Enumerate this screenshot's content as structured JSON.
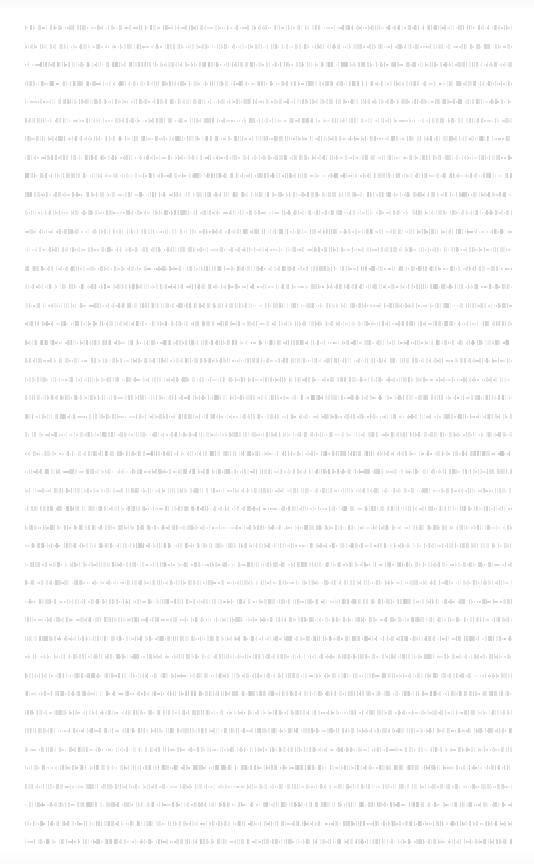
{
  "document": {
    "page_background": "#ffffff",
    "text_color": "#c5c5ca",
    "zoom_level": "fit-page",
    "content_type": "body-text",
    "alignment": "justified",
    "layout": {
      "page_width": 534,
      "page_height": 864,
      "margin_left": 25,
      "margin_right": 22,
      "margin_top": 25,
      "column_width": 487,
      "line_height": 18.6,
      "first_baseline": 28,
      "last_baseline": 852,
      "line_count": 45,
      "paragraph_breaks": [],
      "has_header": false,
      "has_footer": false,
      "has_page_number": false,
      "has_images": false,
      "has_headings": false
    },
    "lines": [
      {
        "index": 1,
        "y": 25,
        "fill": 1.0,
        "density": 0.62,
        "weight": 0.55
      },
      {
        "index": 2,
        "y": 44,
        "fill": 1.0,
        "density": 0.58,
        "weight": 0.48
      },
      {
        "index": 3,
        "y": 62,
        "fill": 1.0,
        "density": 0.66,
        "weight": 0.6
      },
      {
        "index": 4,
        "y": 81,
        "fill": 1.0,
        "density": 0.64,
        "weight": 0.57
      },
      {
        "index": 5,
        "y": 99,
        "fill": 1.0,
        "density": 0.6,
        "weight": 0.52
      },
      {
        "index": 6,
        "y": 118,
        "fill": 1.0,
        "density": 0.55,
        "weight": 0.44
      },
      {
        "index": 7,
        "y": 136,
        "fill": 1.0,
        "density": 0.63,
        "weight": 0.58
      },
      {
        "index": 8,
        "y": 155,
        "fill": 1.0,
        "density": 0.61,
        "weight": 0.54
      },
      {
        "index": 9,
        "y": 173,
        "fill": 1.0,
        "density": 0.67,
        "weight": 0.62
      },
      {
        "index": 10,
        "y": 192,
        "fill": 1.0,
        "density": 0.65,
        "weight": 0.59
      },
      {
        "index": 11,
        "y": 210,
        "fill": 1.0,
        "density": 0.59,
        "weight": 0.5
      },
      {
        "index": 12,
        "y": 229,
        "fill": 1.0,
        "density": 0.64,
        "weight": 0.56
      },
      {
        "index": 13,
        "y": 247,
        "fill": 1.0,
        "density": 0.57,
        "weight": 0.47
      },
      {
        "index": 14,
        "y": 266,
        "fill": 1.0,
        "density": 0.62,
        "weight": 0.55
      },
      {
        "index": 15,
        "y": 284,
        "fill": 1.0,
        "density": 0.66,
        "weight": 0.61
      },
      {
        "index": 16,
        "y": 303,
        "fill": 1.0,
        "density": 0.6,
        "weight": 0.51
      },
      {
        "index": 17,
        "y": 321,
        "fill": 1.0,
        "density": 0.63,
        "weight": 0.57
      },
      {
        "index": 18,
        "y": 340,
        "fill": 1.0,
        "density": 0.68,
        "weight": 0.64
      },
      {
        "index": 19,
        "y": 358,
        "fill": 1.0,
        "density": 0.61,
        "weight": 0.53
      },
      {
        "index": 20,
        "y": 377,
        "fill": 1.0,
        "density": 0.58,
        "weight": 0.49
      },
      {
        "index": 21,
        "y": 395,
        "fill": 1.0,
        "density": 0.65,
        "weight": 0.6
      },
      {
        "index": 22,
        "y": 414,
        "fill": 1.0,
        "density": 0.62,
        "weight": 0.55
      },
      {
        "index": 23,
        "y": 432,
        "fill": 1.0,
        "density": 0.59,
        "weight": 0.5
      },
      {
        "index": 24,
        "y": 451,
        "fill": 1.0,
        "density": 0.67,
        "weight": 0.63
      },
      {
        "index": 25,
        "y": 469,
        "fill": 1.0,
        "density": 0.64,
        "weight": 0.58
      },
      {
        "index": 26,
        "y": 488,
        "fill": 1.0,
        "density": 0.56,
        "weight": 0.46
      },
      {
        "index": 27,
        "y": 506,
        "fill": 1.0,
        "density": 0.63,
        "weight": 0.57
      },
      {
        "index": 28,
        "y": 525,
        "fill": 1.0,
        "density": 0.6,
        "weight": 0.52
      },
      {
        "index": 29,
        "y": 543,
        "fill": 1.0,
        "density": 0.66,
        "weight": 0.61
      },
      {
        "index": 30,
        "y": 562,
        "fill": 1.0,
        "density": 0.62,
        "weight": 0.54
      },
      {
        "index": 31,
        "y": 580,
        "fill": 1.0,
        "density": 0.58,
        "weight": 0.48
      },
      {
        "index": 32,
        "y": 599,
        "fill": 1.0,
        "density": 0.65,
        "weight": 0.59
      },
      {
        "index": 33,
        "y": 617,
        "fill": 1.0,
        "density": 0.61,
        "weight": 0.53
      },
      {
        "index": 34,
        "y": 636,
        "fill": 1.0,
        "density": 0.64,
        "weight": 0.58
      },
      {
        "index": 35,
        "y": 654,
        "fill": 1.0,
        "density": 0.57,
        "weight": 0.47
      },
      {
        "index": 36,
        "y": 673,
        "fill": 1.0,
        "density": 0.62,
        "weight": 0.56
      },
      {
        "index": 37,
        "y": 691,
        "fill": 1.0,
        "density": 0.68,
        "weight": 0.65
      },
      {
        "index": 38,
        "y": 710,
        "fill": 1.0,
        "density": 0.6,
        "weight": 0.51
      },
      {
        "index": 39,
        "y": 728,
        "fill": 1.0,
        "density": 0.63,
        "weight": 0.57
      },
      {
        "index": 40,
        "y": 747,
        "fill": 1.0,
        "density": 0.59,
        "weight": 0.5
      },
      {
        "index": 41,
        "y": 765,
        "fill": 1.0,
        "density": 0.66,
        "weight": 0.62
      },
      {
        "index": 42,
        "y": 784,
        "fill": 1.0,
        "density": 0.55,
        "weight": 0.43
      },
      {
        "index": 43,
        "y": 802,
        "fill": 1.0,
        "density": 0.64,
        "weight": 0.59
      },
      {
        "index": 44,
        "y": 821,
        "fill": 1.0,
        "density": 0.67,
        "weight": 0.63
      },
      {
        "index": 45,
        "y": 839,
        "fill": 1.0,
        "density": 0.65,
        "weight": 0.6
      }
    ]
  }
}
